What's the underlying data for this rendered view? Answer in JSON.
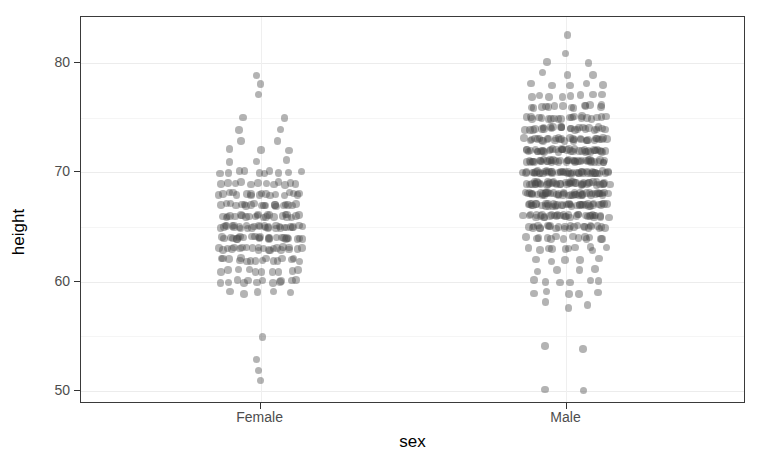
{
  "chart_data": {
    "type": "scatter",
    "plot_style": "jitter strip chart of height by sex",
    "title": "",
    "xlabel": "sex",
    "ylabel": "height",
    "categories": [
      "Female",
      "Male"
    ],
    "x_tick_labels": [
      "Female",
      "Male"
    ],
    "y_tick_labels": [
      "50",
      "60",
      "70",
      "80"
    ],
    "y_ticks": [
      50,
      60,
      70,
      80
    ],
    "ylim": [
      48.8,
      84.2
    ],
    "grid": {
      "major_y": [
        50,
        60,
        70,
        80
      ],
      "minor_y": [
        55,
        65,
        75
      ],
      "major_x": [
        "Female",
        "Male"
      ],
      "visible": true
    },
    "legend": null,
    "point_color": "#4a4a4a",
    "point_opacity": 0.42,
    "panel_background": "#ffffff",
    "panel_border_color": "#3a3a3a",
    "grid_major_color": "#ececec",
    "grid_minor_color": "#f5f5f5",
    "axis_text_color": "#4d4d4d",
    "axis_title_color": "#000000",
    "series": [
      {
        "name": "Female",
        "x_center": 0.27,
        "jitter_halfwidth": 0.062,
        "n": 238,
        "value_counts": [
          {
            "height": 51,
            "count": 1
          },
          {
            "height": 52,
            "count": 1
          },
          {
            "height": 53,
            "count": 1
          },
          {
            "height": 55,
            "count": 1
          },
          {
            "height": 59,
            "count": 5
          },
          {
            "height": 60,
            "count": 12
          },
          {
            "height": 61,
            "count": 10
          },
          {
            "height": 62,
            "count": 16
          },
          {
            "height": 63,
            "count": 22
          },
          {
            "height": 64,
            "count": 26
          },
          {
            "height": 65,
            "count": 30
          },
          {
            "height": 66,
            "count": 24
          },
          {
            "height": 67,
            "count": 20
          },
          {
            "height": 68,
            "count": 18
          },
          {
            "height": 69,
            "count": 12
          },
          {
            "height": 70,
            "count": 10
          },
          {
            "height": 71,
            "count": 3
          },
          {
            "height": 72,
            "count": 3
          },
          {
            "height": 73,
            "count": 2
          },
          {
            "height": 74,
            "count": 2
          },
          {
            "height": 75,
            "count": 2
          },
          {
            "height": 77,
            "count": 1
          },
          {
            "height": 78,
            "count": 1
          },
          {
            "height": 79,
            "count": 1
          }
        ]
      },
      {
        "name": "Male",
        "x_center": 0.73,
        "jitter_halfwidth": 0.062,
        "n": 470,
        "value_counts": [
          {
            "height": 50,
            "count": 2
          },
          {
            "height": 54,
            "count": 2
          },
          {
            "height": 57.5,
            "count": 1
          },
          {
            "height": 58,
            "count": 2
          },
          {
            "height": 59,
            "count": 5
          },
          {
            "height": 60,
            "count": 6
          },
          {
            "height": 61,
            "count": 4
          },
          {
            "height": 62,
            "count": 5
          },
          {
            "height": 63,
            "count": 10
          },
          {
            "height": 64,
            "count": 14
          },
          {
            "height": 65,
            "count": 26
          },
          {
            "height": 66,
            "count": 34
          },
          {
            "height": 67,
            "count": 40
          },
          {
            "height": 68,
            "count": 46
          },
          {
            "height": 69,
            "count": 44
          },
          {
            "height": 70,
            "count": 48
          },
          {
            "height": 71,
            "count": 42
          },
          {
            "height": 72,
            "count": 40
          },
          {
            "height": 73,
            "count": 32
          },
          {
            "height": 74,
            "count": 26
          },
          {
            "height": 75,
            "count": 20
          },
          {
            "height": 76,
            "count": 14
          },
          {
            "height": 77,
            "count": 8
          },
          {
            "height": 78,
            "count": 5
          },
          {
            "height": 79,
            "count": 3
          },
          {
            "height": 80,
            "count": 2
          },
          {
            "height": 81,
            "count": 1
          },
          {
            "height": 82.5,
            "count": 1
          }
        ]
      }
    ]
  },
  "axes": {
    "y_title": "height",
    "x_title": "sex"
  },
  "y_axis": {
    "ticks": [
      {
        "label": "80",
        "value": 80
      },
      {
        "label": "70",
        "value": 70
      },
      {
        "label": "60",
        "value": 60
      },
      {
        "label": "50",
        "value": 50
      }
    ]
  },
  "x_axis": {
    "ticks": [
      {
        "label": "Female",
        "value": 0.27
      },
      {
        "label": "Male",
        "value": 0.73
      }
    ]
  }
}
